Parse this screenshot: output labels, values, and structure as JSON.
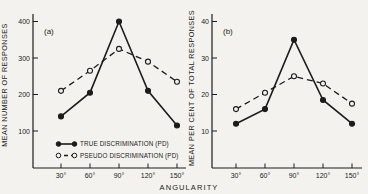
{
  "figure": {
    "background": "#f3f2ee",
    "ink": "#1c1c1c",
    "xlabel": "ANGULARITY"
  },
  "chart_data": [
    {
      "type": "line",
      "panel_label": "(a)",
      "title": "",
      "xlabel": "ANGULARITY",
      "ylabel": "MEAN NUMBER OF RESPONSES",
      "categories": [
        "30°",
        "60°",
        "90°",
        "120°",
        "150°"
      ],
      "yticks": [
        100,
        200,
        300,
        400
      ],
      "ylim": [
        0,
        420
      ],
      "grid": false,
      "legend_position": "lower-left",
      "series": [
        {
          "name": "TRUE DISCRIMINATION (PD)",
          "marker": "filled-circle",
          "line_style": "solid",
          "values": [
            140,
            205,
            400,
            210,
            115
          ]
        },
        {
          "name": "PSEUDO DISCRIMINATION (PD)",
          "marker": "open-circle",
          "line_style": "dashed",
          "values": [
            210,
            265,
            325,
            290,
            235
          ]
        }
      ]
    },
    {
      "type": "line",
      "panel_label": "(b)",
      "title": "",
      "xlabel": "ANGULARITY",
      "ylabel": "MEAN PER CENT OF TOTAL RESPONSES",
      "categories": [
        "30°",
        "60°",
        "90°",
        "120°",
        "150°"
      ],
      "yticks": [
        10,
        20,
        30,
        40
      ],
      "ylim": [
        0,
        42
      ],
      "grid": false,
      "legend_position": "none",
      "series": [
        {
          "name": "TRUE DISCRIMINATION (PD)",
          "marker": "filled-circle",
          "line_style": "solid",
          "values": [
            12,
            16,
            35,
            18.5,
            12
          ]
        },
        {
          "name": "PSEUDO DISCRIMINATION (PD)",
          "marker": "open-circle",
          "line_style": "dashed",
          "values": [
            16,
            20.5,
            25,
            23,
            17.5
          ]
        }
      ]
    }
  ]
}
